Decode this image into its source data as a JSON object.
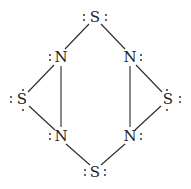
{
  "atoms": [
    {
      "id": "s_top",
      "symbol": "S",
      "x": 95,
      "y": 17,
      "lone_pairs": [
        "left",
        "right"
      ]
    },
    {
      "id": "n_ul",
      "symbol": "N",
      "x": 60,
      "y": 57,
      "lone_pairs": [
        "left"
      ]
    },
    {
      "id": "n_ur",
      "symbol": "N",
      "x": 130,
      "y": 57,
      "lone_pairs": [
        "right"
      ]
    },
    {
      "id": "s_left",
      "symbol": "S",
      "x": 22,
      "y": 100,
      "lone_pairs": [
        "left",
        "top-bottom"
      ]
    },
    {
      "id": "s_right",
      "symbol": "S",
      "x": 168,
      "y": 100,
      "lone_pairs": [
        "right",
        "top-bottom"
      ]
    },
    {
      "id": "n_ll",
      "symbol": "N",
      "x": 60,
      "y": 136,
      "lone_pairs": [
        "left"
      ]
    },
    {
      "id": "n_lr",
      "symbol": "N",
      "x": 130,
      "y": 136,
      "lone_pairs": [
        "right"
      ]
    },
    {
      "id": "s_bottom",
      "symbol": "S",
      "x": 95,
      "y": 173,
      "lone_pairs": [
        "left",
        "right"
      ]
    }
  ],
  "bonds": [
    [
      "s_top",
      "n_ul"
    ],
    [
      "s_top",
      "n_ur"
    ],
    [
      "n_ul",
      "s_left"
    ],
    [
      "n_ur",
      "s_right"
    ],
    [
      "n_ul",
      "n_ll"
    ],
    [
      "n_ur",
      "n_lr"
    ],
    [
      "s_left",
      "n_ll"
    ],
    [
      "s_right",
      "n_lr"
    ],
    [
      "n_ll",
      "s_bottom"
    ],
    [
      "n_lr",
      "s_bottom"
    ]
  ],
  "labels": {
    "s_top": "S",
    "n_ul": "N",
    "n_ur": "N",
    "s_left": "S",
    "s_right": "S",
    "n_ll": "N",
    "n_lr": "N",
    "s_bottom": "S"
  }
}
